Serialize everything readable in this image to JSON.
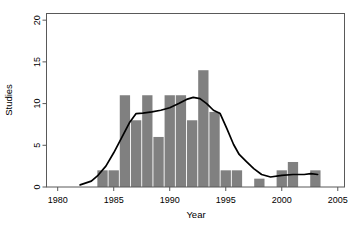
{
  "figure": {
    "background_color": "#ffffff",
    "frame_color": "#595959",
    "bar_color": "#808080",
    "line_color": "#000000"
  },
  "axes": {
    "x": {
      "title": "Year",
      "ticks": [
        1980,
        1985,
        1990,
        1995,
        2000,
        2005
      ],
      "tick_labels": [
        "1980",
        "1985",
        "1990",
        "1995",
        "2000",
        "2005"
      ],
      "min": 1979.0,
      "max": 2005.6
    },
    "y": {
      "title": "Studies",
      "ticks": [
        0,
        5,
        10,
        15,
        20
      ],
      "tick_labels": [
        "0",
        "5",
        "10",
        "15",
        "20"
      ],
      "min": 0,
      "max": 20.8
    }
  },
  "chart_data": {
    "type": "bar",
    "title": "",
    "xlabel": "Year",
    "ylabel": "Studies",
    "xlim": [
      1979.0,
      2005.6
    ],
    "ylim": [
      0,
      20.8
    ],
    "grid": false,
    "legend": "none",
    "categories": [
      "1984",
      "1985",
      "1986",
      "1987",
      "1988",
      "1989",
      "1990",
      "1991",
      "1992",
      "1993",
      "1994",
      "1995",
      "1996",
      "1997",
      "1998",
      "1999",
      "2000",
      "2001",
      "2002",
      "2003"
    ],
    "values": [
      2,
      2,
      11,
      8,
      11,
      6,
      11,
      11,
      8,
      14,
      9,
      2,
      2,
      0,
      1,
      0,
      2,
      3,
      0,
      2
    ],
    "series": [
      {
        "name": "Studies",
        "type": "bar",
        "x": [
          1984,
          1985,
          1986,
          1987,
          1988,
          1989,
          1990,
          1991,
          1992,
          1993,
          1994,
          1995,
          1996,
          1997,
          1998,
          1999,
          2000,
          2001,
          2002,
          2003
        ],
        "values": [
          2,
          2,
          11,
          8,
          11,
          6,
          11,
          11,
          8,
          14,
          9,
          2,
          2,
          0,
          1,
          0,
          2,
          3,
          0,
          2
        ]
      },
      {
        "name": "Smoothed trend",
        "type": "line",
        "x": [
          1982.0,
          1983.0,
          1983.6,
          1984.3,
          1985.0,
          1985.7,
          1986.4,
          1987.0,
          1987.6,
          1988.4,
          1989.2,
          1990.0,
          1990.8,
          1991.5,
          1992.1,
          1992.7,
          1993.3,
          1993.9,
          1994.5,
          1995.1,
          1995.7,
          1996.2,
          1996.8,
          1997.5,
          1998.2,
          1999.0,
          2000.0,
          2001.0,
          2002.0,
          2002.6,
          2003.2
        ],
        "values": [
          0.25,
          0.7,
          1.4,
          2.5,
          4.1,
          5.9,
          7.7,
          8.8,
          8.85,
          9.0,
          9.2,
          9.5,
          10.0,
          10.5,
          10.75,
          10.6,
          10.0,
          9.2,
          8.8,
          7.0,
          5.1,
          3.9,
          3.1,
          2.2,
          1.5,
          1.2,
          1.4,
          1.5,
          1.5,
          1.6,
          1.5
        ]
      }
    ]
  }
}
